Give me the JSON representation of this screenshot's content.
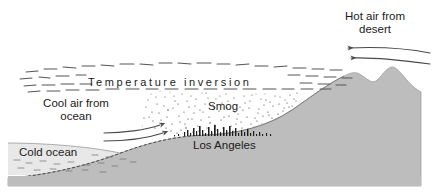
{
  "figure": {
    "type": "cross-section-diagram",
    "width": 432,
    "height": 195
  },
  "labels": {
    "hot_air": "Hot air from\ndesert",
    "temperature_inversion": "Temperature inversion",
    "cool_air": "Cool air from\nocean",
    "smog": "Smog",
    "los_angeles": "Los Angeles",
    "cold_ocean": "Cold ocean"
  },
  "colors": {
    "land": "#bdbdbd",
    "land_edge": "#9a9a9a",
    "ocean": "#e8e8e8",
    "ink": "#1b1b1b",
    "inversion_dash": "#5a5a5a",
    "smog_dot": "#2b2b2b",
    "arrow": "#4a4a4a",
    "background": "#ffffff"
  },
  "arrows": [
    {
      "name": "hot-air-arrow-upper",
      "direction": "left",
      "from_x": 430,
      "from_y": 52,
      "to_x": 345,
      "to_y": 48
    },
    {
      "name": "hot-air-arrow-lower",
      "direction": "left",
      "from_x": 430,
      "from_y": 63,
      "to_x": 348,
      "to_y": 58
    },
    {
      "name": "cool-air-arrow-upper",
      "direction": "right",
      "from_x": 104,
      "from_y": 132,
      "to_x": 163,
      "to_y": 126
    },
    {
      "name": "cool-air-arrow-lower",
      "direction": "right",
      "from_x": 104,
      "from_y": 140,
      "to_x": 166,
      "to_y": 134
    }
  ],
  "regions": [
    {
      "name": "sky",
      "description": "white sky above inversion layer"
    },
    {
      "name": "inversion-layer",
      "description": "band of short horizontal dashes across the scene"
    },
    {
      "name": "smog-layer",
      "description": "stippled dark dots trapped between the ground and the inversion"
    },
    {
      "name": "land-mass",
      "description": "gray terrain rising from the coast to a twin-peaked mountain ridge on the right"
    },
    {
      "name": "ocean",
      "description": "light gray cold ocean band at lower left"
    },
    {
      "name": "city-skyline",
      "description": "small black building silhouettes along the basin floor"
    }
  ]
}
